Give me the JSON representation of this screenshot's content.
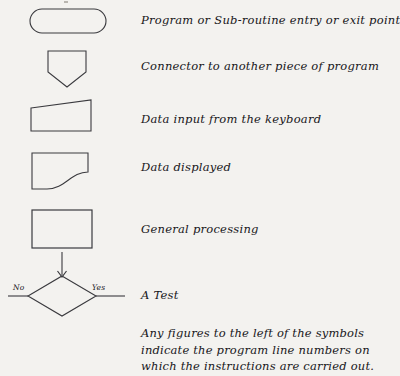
{
  "document": {
    "kind": "flowchart-symbol-legend",
    "background_color": "#f3f2ef",
    "ink_color": "#2a2a2e"
  },
  "rows": [
    {
      "symbol": "rounded-terminator-shape",
      "label": "Program or Sub-routine entry or exit point"
    },
    {
      "symbol": "connector-pentagon-shape",
      "label": "Connector to another piece of program"
    },
    {
      "symbol": "keyboard-input-trapezoid-shape",
      "label": "Data input from the keyboard"
    },
    {
      "symbol": "display-curved-shape",
      "label": "Data displayed"
    },
    {
      "symbol": "process-rectangle-shape",
      "label": "General processing"
    },
    {
      "symbol": "decision-diamond-shape",
      "label": "A Test",
      "branch_left": "No",
      "branch_right": "Yes"
    }
  ],
  "note": {
    "lines": [
      "Any figures to the left of the symbols",
      "indicate the program line numbers on",
      "which the instructions are carried out."
    ]
  }
}
